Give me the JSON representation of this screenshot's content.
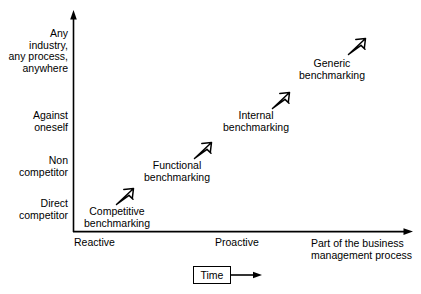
{
  "diagram": {
    "y_axis": {
      "name": "comparison scope",
      "arrow": "up",
      "tick_labels": [
        "Any\nindustry,\nany process,\nanywhere",
        "Against\noneself",
        "Non\ncompetitor",
        "Direct\ncompetitor"
      ]
    },
    "x_axis": {
      "name": "Part of the business management process",
      "arrow": "right",
      "tick_labels": [
        "Reactive",
        "Proactive"
      ],
      "end_label": "Part of the business\nmanagement process"
    },
    "items": [
      {
        "label": "Competitive\nbenchmarking",
        "arrow": "up-right-arrow-icon"
      },
      {
        "label": "Functional\nbenchmarking",
        "arrow": "up-right-arrow-icon"
      },
      {
        "label": "Internal\nbenchmarking",
        "arrow": "up-right-arrow-icon"
      },
      {
        "label": "Generic\nbenchmarking",
        "arrow": "up-right-arrow-icon"
      }
    ],
    "legend": {
      "box_label": "Time",
      "arrow": "right-arrow-icon"
    },
    "colors": {
      "stroke": "#000000",
      "background": "#ffffff",
      "text": "#000000"
    }
  }
}
